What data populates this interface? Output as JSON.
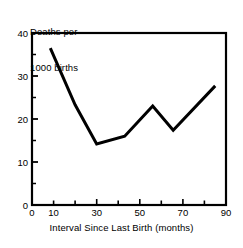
{
  "chart_data": {
    "type": "line",
    "title": "",
    "subtitle": "",
    "xlabel": "Interval Since Last Birth (months)",
    "ylabel": "Deaths per\n1000 births",
    "ylabel_lines": [
      "Deaths per",
      "1000 births"
    ],
    "xlim": [
      0,
      90
    ],
    "ylim": [
      0,
      40
    ],
    "xticks": [
      0,
      10,
      20,
      30,
      40,
      50,
      60,
      70,
      80,
      90
    ],
    "xticklabels": [
      "0",
      "",
      "10",
      "",
      "30",
      "",
      "50",
      "",
      "70",
      "",
      "90"
    ],
    "xtick_labeled": [
      0,
      10,
      30,
      50,
      70,
      90
    ],
    "xtick_labeled_text": [
      "0",
      "10",
      "30",
      "50",
      "70",
      "90"
    ],
    "ytick_labeled": [
      0,
      10,
      20,
      30,
      40
    ],
    "ytick_labeled_text": [
      "0",
      "10",
      "20",
      "30",
      "40"
    ],
    "ytick_minor": [
      5,
      15,
      25,
      35
    ],
    "grid": false,
    "legend": null,
    "line_color": "#000000",
    "line_width": 3,
    "frame": true,
    "series": [
      {
        "name": "Deaths per 1000 births",
        "x": [
          8.5,
          20,
          30,
          43,
          56,
          65.5,
          85
        ],
        "values": [
          36.5,
          23.3,
          14.2,
          16.0,
          23.0,
          17.4,
          27.7
        ]
      }
    ]
  },
  "axes": {
    "x_axis_name": "interval-since-last-birth",
    "y_axis_name": "deaths-per-1000-births"
  }
}
